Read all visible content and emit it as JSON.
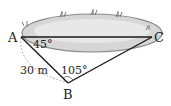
{
  "diagram": {
    "points": {
      "A": "A",
      "B": "B",
      "C": "C"
    },
    "angles": {
      "A": "45°",
      "B": "105°"
    },
    "lengths": {
      "AB": "30 m"
    },
    "colors": {
      "pond": "#d9d9d9",
      "pond_edge": "#9a9a9a",
      "line": "#1a1a1a",
      "dotted": "#9a9a9a"
    }
  }
}
